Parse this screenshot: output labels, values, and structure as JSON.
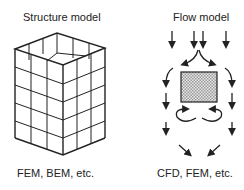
{
  "left": {
    "title": "Structure model",
    "caption": "FEM, BEM,  etc.",
    "icon": "mesh-box-icon"
  },
  "right": {
    "title": "Flow model",
    "caption": "CFD, FEM,  etc.",
    "icon": "flow-arrows-icon"
  },
  "colors": {
    "line": "#222222",
    "background": "#ffffff",
    "hatch": "#888888"
  }
}
